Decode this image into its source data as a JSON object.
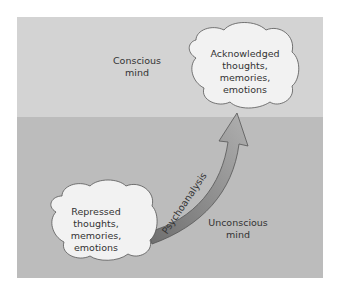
{
  "conscious_label": [
    "Conscious",
    "mind"
  ],
  "unconscious_label": [
    "Unconscious",
    "mind"
  ],
  "acknowledged_cloud": [
    "Acknowledged",
    "thoughts,",
    "memories,",
    "emotions"
  ],
  "repressed_cloud": [
    "Repressed",
    "thoughts,",
    "memories,",
    "emotions"
  ],
  "arrow_label": "Psychoanalysis",
  "colors": {
    "conscious_region": "#d3d3d3",
    "unconscious_region": "#bcbcbc",
    "cloud_fill": "#f2f2f2",
    "arrow_dark": "#6e6e6e",
    "arrow_light": "#a8a8a8"
  }
}
